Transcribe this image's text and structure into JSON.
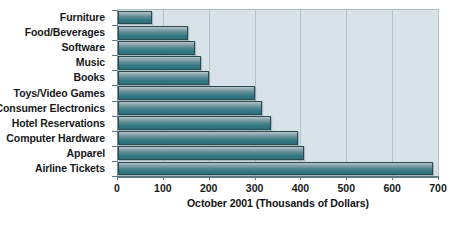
{
  "chart_data": {
    "type": "bar",
    "orientation": "horizontal",
    "title": "",
    "xlabel": "October 2001 (Thousands of Dollars)",
    "ylabel": "",
    "xlim": [
      0,
      700
    ],
    "xticks": [
      0,
      100,
      200,
      300,
      400,
      500,
      600,
      700
    ],
    "grid": true,
    "legend": null,
    "categories": [
      "Furniture",
      "Food/Beverages",
      "Software",
      "Music",
      "Books",
      "Toys/Video Games",
      "Consumer Electronics",
      "Hotel Reservations",
      "Computer Hardware",
      "Apparel",
      "Airline Tickets"
    ],
    "values": [
      75,
      152,
      168,
      181,
      198,
      299,
      314,
      334,
      392,
      406,
      688
    ],
    "bar_color_top": "#b9c6cc",
    "bar_color_bottom": "#2c7079",
    "plot_background": "#d7e3e9",
    "gridline_color": "#b3c3ca",
    "text_color": "#17181a"
  }
}
